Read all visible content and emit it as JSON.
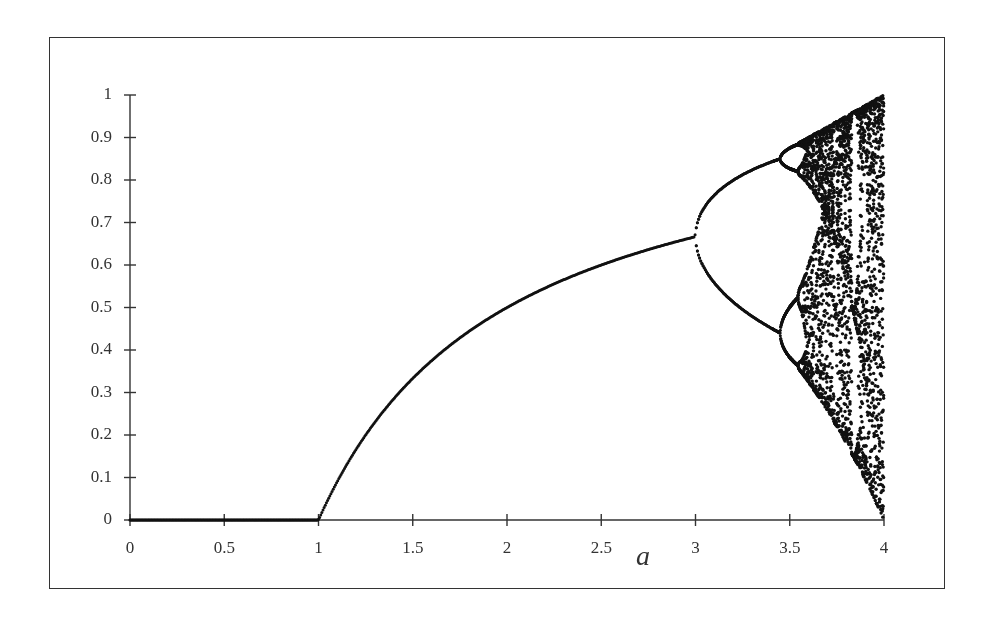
{
  "chart_data": {
    "type": "scatter",
    "title": "",
    "xlabel": "a",
    "ylabel": "",
    "xlim": [
      0,
      4
    ],
    "ylim": [
      0,
      1
    ],
    "grid": false,
    "legend": null,
    "xticks": [
      0,
      0.5,
      1,
      1.5,
      2,
      2.5,
      3,
      3.5,
      4
    ],
    "xtick_labels": [
      "0",
      "0.5",
      "1",
      "1.5",
      "2",
      "2.5",
      "3",
      "3.5",
      "4"
    ],
    "yticks": [
      0,
      0.1,
      0.2,
      0.3,
      0.4,
      0.5,
      0.6,
      0.7,
      0.8,
      0.9,
      1
    ],
    "ytick_labels": [
      "0",
      "0.1",
      "0.2",
      "0.3",
      "0.4",
      "0.5",
      "0.6",
      "0.7",
      "0.8",
      "0.9",
      "1"
    ],
    "series": [
      {
        "name": "fixed point 0",
        "a_range": [
          0,
          1
        ],
        "x": 0
      },
      {
        "name": "stable fixed point 1-1/a",
        "a_range": [
          1,
          3
        ],
        "points": [
          [
            1,
            0
          ],
          [
            1.5,
            0.333
          ],
          [
            2,
            0.5
          ],
          [
            2.5,
            0.6
          ],
          [
            3,
            0.667
          ]
        ]
      },
      {
        "name": "period-2 branch",
        "a_range": [
          3,
          3.449
        ],
        "upper": [
          [
            3,
            0.667
          ],
          [
            3.2,
            0.799
          ],
          [
            3.449,
            0.852
          ]
        ],
        "lower": [
          [
            3,
            0.667
          ],
          [
            3.2,
            0.513
          ],
          [
            3.449,
            0.44
          ]
        ]
      },
      {
        "name": "period-4 bubbles",
        "a_range": [
          3.449,
          3.544
        ]
      },
      {
        "name": "chaotic band",
        "a_range": [
          3.57,
          4
        ],
        "envelope_top": [
          [
            3.57,
            0.89
          ],
          [
            4,
            1
          ]
        ],
        "envelope_bottom": [
          [
            3.57,
            0.33
          ],
          [
            4,
            0
          ]
        ]
      }
    ],
    "marker_color": "#111111"
  }
}
